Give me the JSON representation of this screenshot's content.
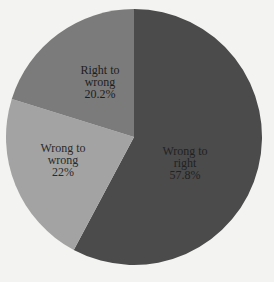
{
  "chart_data": {
    "type": "pie",
    "title": "",
    "start_angle_deg": 0,
    "direction": "clockwise",
    "slices": [
      {
        "label": "Wrong to right",
        "value": 57.8,
        "display": "57.8%",
        "color": "#4b4b4b",
        "text_color": "#222222",
        "label_pos": [
          185,
          163
        ]
      },
      {
        "label": "Wrong to wrong",
        "value": 22,
        "display": "22%",
        "color": "#a3a3a3",
        "text_color": "#2a2a2a",
        "label_pos": [
          63,
          160
        ]
      },
      {
        "label": "Right to wrong",
        "value": 20.2,
        "display": "20.2%",
        "color": "#7b7b7b",
        "text_color": "#1e1e1e",
        "label_pos": [
          100,
          82
        ]
      }
    ],
    "legend": "none",
    "center": [
      134,
      137
    ],
    "radius": 128
  },
  "labels": {
    "wrong_to_right": {
      "line1": "Wrong to",
      "line2": "right",
      "pct": "57.8%"
    },
    "wrong_to_wrong": {
      "line1": "Wrong to",
      "line2": "wrong",
      "pct": "22%"
    },
    "right_to_wrong": {
      "line1": "Right to",
      "line2": "wrong",
      "pct": "20.2%"
    }
  }
}
